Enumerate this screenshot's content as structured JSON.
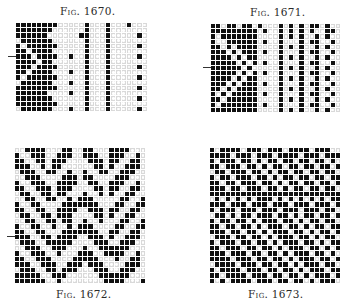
{
  "figures": [
    {
      "caption": "Fig. 1670.",
      "cols": 25,
      "rows": [
        "1111111100000100010001000",
        "1111111000000100010000000",
        "1111110000001100010000010",
        "0111111000000100010000000",
        "1011111100000100010000010",
        "1101111000000100010000000",
        "1110111100100100010000010",
        "1111011000000100010000000",
        "1110111100000100010000010",
        "1101111000100100010000000",
        "1011111100000100010000010",
        "0111111000100100010000000",
        "1111111100000100010000010",
        "1111110000100100010000000",
        "1111111000000100010000010",
        "1111111100000100010000000",
        "0111111000100100010000010"
      ]
    },
    {
      "caption": "Fig. 1671.",
      "cols": 25,
      "rows": [
        "1101101101000101010110100",
        "1111111110100101010100110",
        "1011111110000101010010100",
        "1001111110100100010110010",
        "1101011110000101010010100",
        "1110101110100100010110010",
        "1111010110000101010010100",
        "1111101010100100010110010",
        "1111110100000101010010100",
        "1111101010100100010110010",
        "1111010110000101010010100",
        "1110101110100100010110010",
        "1101011110000101010010100",
        "1010111110100100010110010",
        "1101111110000101010010100",
        "1011111110100100010110010",
        "1111111110000101010010100"
      ]
    },
    {
      "caption": "Fig. 1672.",
      "cols": 25,
      "rows": [
        "0011110001100110001111000",
        "1001110011100111001110010",
        "1100110111000011101100110",
        "1110010110000001101001110",
        "0111001100100100110011100",
        "0011100001110110000111000",
        "1001110011110011001110010",
        "1100111011100001101100110",
        "0110011011000100101001100",
        "0011001100101110000011001",
        "1001100001111111000110011",
        "1100110011110011101100110",
        "0110011011100001101001100",
        "0011001101100100100011001",
        "1001100100101110000110011",
        "1100110001111111001100110",
        "1110011011110011101001110",
        "0111001111100001110011100",
        "0011100111000100111111000",
        "1001110010001110011110010",
        "1100111000011111000100110",
        "1110011100111011100001110",
        "0111001101110001110011100",
        "1111100111000000111111000",
        "1111110010000000011110001"
      ]
    },
    {
      "caption": "Fig. 1673.",
      "cols": 25,
      "rows": [
        "1011110111011101111011100",
        "1111011101110111101110111",
        "1011101101011011011011010",
        "1101110110101101101101101",
        "0110111011010110110110110",
        "1011011101101011011011011",
        "1101101110110101101101101",
        "1110110111011010110110110",
        "1111111111111111111111111",
        "0101010101110101010101011",
        "1110111011101110111011101",
        "1011101110111011101110110",
        "0110101101110110101101101",
        "1011011010111011010110110",
        "1101101101011101101011011",
        "1110110110101110110101101",
        "0111011011010111011010110",
        "1011101101101011101101011",
        "1101110110110101110110101",
        "1110111011011010111011010",
        "1111011101101101011101101",
        "0111101110110110101110110",
        "1011110111011011010111011",
        "1101111011101101101011101",
        "1010111101110110110101110"
      ]
    }
  ]
}
